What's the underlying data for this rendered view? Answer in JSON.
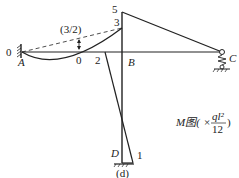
{
  "diagram": {
    "caption": "(d)",
    "legend": {
      "prefix": "M图(",
      "times": "×",
      "numerator": "ql²",
      "denominator": "12",
      "suffix": ")"
    },
    "nodes": {
      "A": "A",
      "B": "B",
      "C": "C",
      "D": "D"
    },
    "values": {
      "left_end": "0",
      "mid_span": "0",
      "diag_top": "2",
      "top_5": "5",
      "top_3": "3",
      "bottom_1": "1",
      "sag": "(3/2)"
    },
    "colors": {
      "line": "#222222",
      "background": "#ffffff"
    }
  }
}
